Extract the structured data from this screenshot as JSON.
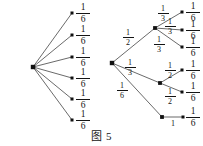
{
  "caption": {
    "text": "图 5",
    "x": 0,
    "y": 127
  },
  "colors": {
    "background": "#ffffff",
    "line": "#2a2a2a",
    "node": "#111111",
    "text": "#141414"
  },
  "chart_data": {
    "type": "diagram",
    "title": "图 5",
    "subtype": "probability-tree-diagrams",
    "diagrams": [
      {
        "name": "left-fan-diagram",
        "root": {
          "x": 33,
          "y": 67
        },
        "leaves": [
          {
            "x": 72,
            "y": 13,
            "label_num": "1",
            "label_den": "6",
            "label_x": 83,
            "label_y": 13
          },
          {
            "x": 72,
            "y": 35,
            "label_num": "1",
            "label_den": "6",
            "label_x": 83,
            "label_y": 35
          },
          {
            "x": 72,
            "y": 57,
            "label_num": "1",
            "label_den": "6",
            "label_x": 83,
            "label_y": 57
          },
          {
            "x": 72,
            "y": 78,
            "label_num": "1",
            "label_den": "6",
            "label_x": 83,
            "label_y": 78
          },
          {
            "x": 72,
            "y": 99,
            "label_num": "1",
            "label_den": "6",
            "label_x": 83,
            "label_y": 99
          },
          {
            "x": 72,
            "y": 120,
            "label_num": "1",
            "label_den": "6",
            "label_x": 83,
            "label_y": 120
          }
        ]
      },
      {
        "name": "right-tree-diagram",
        "root": {
          "x": 112,
          "y": 63
        },
        "internal_nodes": [
          {
            "id": "upper",
            "x": 155,
            "y": 28
          },
          {
            "id": "middle",
            "x": 160,
            "y": 83
          },
          {
            "id": "lower",
            "x": 162,
            "y": 117
          }
        ],
        "root_edges": [
          {
            "to": "upper",
            "num": "1",
            "den": "2",
            "label_x": 128,
            "label_y": 37
          },
          {
            "to": "middle",
            "num": "1",
            "den": "3",
            "label_x": 130,
            "label_y": 67
          },
          {
            "to": "lower",
            "num": "1",
            "den": "6",
            "label_x": 122,
            "label_y": 90
          }
        ],
        "sub_edges": [
          {
            "from": "upper",
            "num": "1",
            "den": "3",
            "label_x": 163,
            "label_y": 13
          },
          {
            "from": "upper",
            "num": "1",
            "den": "3",
            "label_x": 170,
            "label_y": 26
          },
          {
            "from": "upper",
            "num": "1",
            "den": "3",
            "label_x": 159,
            "label_y": 44
          },
          {
            "from": "middle",
            "num": "1",
            "den": "2",
            "label_x": 170,
            "label_y": 70
          },
          {
            "from": "middle",
            "num": "1",
            "den": "2",
            "label_x": 170,
            "label_y": 96
          },
          {
            "from": "lower",
            "whole": "1",
            "label_x": 173,
            "label_y": 124
          }
        ],
        "leaves": [
          {
            "x": 182,
            "y": 12,
            "parent": "upper",
            "label_num": "1",
            "label_den": "6",
            "label_x": 193,
            "label_y": 12
          },
          {
            "x": 182,
            "y": 30,
            "parent": "upper",
            "label_num": "1",
            "label_den": "6",
            "label_x": 193,
            "label_y": 30
          },
          {
            "x": 182,
            "y": 47,
            "parent": "upper",
            "label_num": "1",
            "label_den": "6",
            "label_x": 193,
            "label_y": 47
          },
          {
            "x": 182,
            "y": 70,
            "parent": "middle",
            "label_num": "1",
            "label_den": "6",
            "label_x": 193,
            "label_y": 70
          },
          {
            "x": 182,
            "y": 92,
            "parent": "middle",
            "label_num": "1",
            "label_den": "6",
            "label_x": 193,
            "label_y": 92
          },
          {
            "x": 183,
            "y": 117,
            "parent": "lower",
            "label_num": "1",
            "label_den": "6",
            "label_x": 193,
            "label_y": 117
          }
        ]
      }
    ]
  }
}
